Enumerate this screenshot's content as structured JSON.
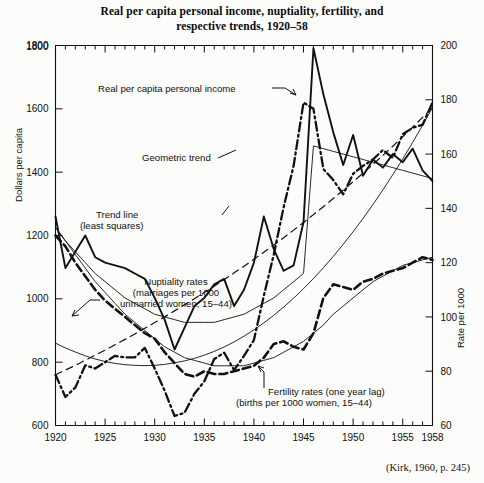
{
  "title": {
    "line1": "Real per capita personal income, nuptiality, fertility, and",
    "line2": "respective trends, 1920–58"
  },
  "source_note": "(Kirk, 1960, p. 245)",
  "axes": {
    "left_title": "Dollars per capita",
    "right_title": "Rate per 1000",
    "left_ticks": [
      "1800",
      "1600",
      "1400",
      "1200",
      "1000",
      "800",
      "600"
    ],
    "right_ticks": [
      "200",
      "180",
      "160",
      "140",
      "120",
      "100",
      "80",
      "60"
    ],
    "x_ticks": [
      "1920",
      "1925",
      "1930",
      "1935",
      "1940",
      "1945",
      "1950",
      "1955",
      "1958"
    ]
  },
  "annotations": {
    "income": "Real per capita personal income",
    "geometric_trend": "Geometric trend",
    "trend_line_1": "Trend line",
    "trend_line_2": "(least squares)",
    "nuptiality_1": "Nuptiality rates",
    "nuptiality_2": "(marriages per 1000",
    "nuptiality_3": "unmarried women, 15–44)",
    "fertility_1": "Fertility rates (one year lag)",
    "fertility_2": "(births per 1000 women, 15–44)"
  },
  "chart_data": {
    "type": "line",
    "title": "Real per capita personal income, nuptiality, fertility, and respective trends, 1920–58",
    "xlabel": "",
    "ylabel": "Dollars per capita",
    "y2label": "Rate per 1000",
    "xlim": [
      1920,
      1958
    ],
    "ylim": [
      600,
      1800
    ],
    "y2lim": [
      60,
      200
    ],
    "grid": false,
    "legend": "annotations-on-plot",
    "x": [
      1920,
      1921,
      1922,
      1923,
      1924,
      1925,
      1926,
      1927,
      1928,
      1929,
      1930,
      1931,
      1932,
      1933,
      1934,
      1935,
      1936,
      1937,
      1938,
      1939,
      1940,
      1941,
      1942,
      1943,
      1944,
      1945,
      1946,
      1947,
      1948,
      1949,
      1950,
      1951,
      1952,
      1953,
      1954,
      1955,
      1956,
      1957,
      1958
    ],
    "series": [
      {
        "name": "Real per capita personal income",
        "axis": "left",
        "units": "dollars per capita",
        "style": "dash-dot",
        "values": [
          760,
          690,
          720,
          790,
          780,
          800,
          820,
          815,
          815,
          845,
          780,
          710,
          630,
          640,
          700,
          740,
          810,
          830,
          775,
          820,
          870,
          1010,
          1140,
          1290,
          1420,
          1620,
          1600,
          1410,
          1375,
          1330,
          1395,
          1420,
          1440,
          1470,
          1445,
          1520,
          1540,
          1550,
          1620
        ]
      },
      {
        "name": "Geometric trend",
        "axis": "left",
        "units": "dollars per capita",
        "style": "dashed",
        "values": [
          760,
          775,
          790,
          806,
          822,
          838,
          855,
          872,
          889,
          907,
          925,
          943,
          962,
          981,
          1000,
          1020,
          1040,
          1061,
          1082,
          1103,
          1125,
          1147,
          1170,
          1193,
          1217,
          1241,
          1266,
          1291,
          1317,
          1343,
          1370,
          1397,
          1425,
          1453,
          1482,
          1512,
          1542,
          1573,
          1604
        ]
      },
      {
        "name": "Trend line (least squares) — income",
        "axis": "left",
        "units": "dollars per capita",
        "style": "thin-solid",
        "values": [
          860,
          845,
          832,
          820,
          810,
          802,
          796,
          792,
          790,
          789,
          790,
          793,
          798,
          804,
          812,
          822,
          834,
          848,
          864,
          882,
          902,
          924,
          948,
          974,
          1002,
          1032,
          1064,
          1098,
          1134,
          1172,
          1212,
          1254,
          1298,
          1344,
          1392,
          1442,
          1494,
          1548,
          1604
        ]
      },
      {
        "name": "Nuptiality rates (marriages per 1000 unmarried women, 15–44)",
        "axis": "right",
        "units": "rate per 1000",
        "style": "solid",
        "values": [
          137,
          118,
          124,
          130,
          122,
          120,
          119,
          118,
          116,
          114,
          107,
          99,
          88,
          96,
          104,
          107,
          112,
          114,
          104,
          110,
          120,
          137,
          125,
          117,
          119,
          135,
          199,
          182,
          168,
          156,
          167,
          152,
          158,
          155,
          160,
          157,
          162,
          154,
          150
        ]
      },
      {
        "name": "Nuptiality trend (least squares)",
        "axis": "right",
        "units": "rate per 1000",
        "style": "thin-solid",
        "values": [
          133,
          128,
          124,
          120,
          116,
          113,
          110,
          107,
          105,
          103,
          101,
          100,
          99,
          98,
          98,
          98,
          98,
          99,
          100,
          101,
          103,
          105,
          107,
          110,
          113,
          116,
          163,
          162,
          161,
          160,
          159,
          158,
          157,
          156,
          155,
          154,
          153,
          152,
          151
        ]
      },
      {
        "name": "Fertility rates (one year lag) (births per 1000 women, 15–44)",
        "axis": "right",
        "units": "rate per 1000",
        "style": "heavy-dashed",
        "values": [
          130,
          126,
          120,
          115,
          110,
          106,
          103,
          100,
          97,
          94,
          92,
          87,
          83,
          79,
          78,
          80,
          79,
          79,
          80,
          81,
          82,
          85,
          90,
          91,
          89,
          88,
          94,
          107,
          112,
          111,
          110,
          113,
          114,
          116,
          117,
          118,
          120,
          122,
          121
        ]
      },
      {
        "name": "Fertility trend",
        "axis": "right",
        "units": "rate per 1000",
        "style": "thin-solid",
        "values": [
          133,
          128,
          123,
          118,
          113,
          109,
          105,
          101,
          98,
          95,
          92,
          89,
          87,
          85,
          84,
          83,
          82,
          82,
          82,
          82,
          83,
          84,
          85,
          87,
          89,
          91,
          94,
          97,
          101,
          104,
          107,
          110,
          113,
          115,
          117,
          119,
          120,
          121,
          122
        ]
      }
    ]
  }
}
